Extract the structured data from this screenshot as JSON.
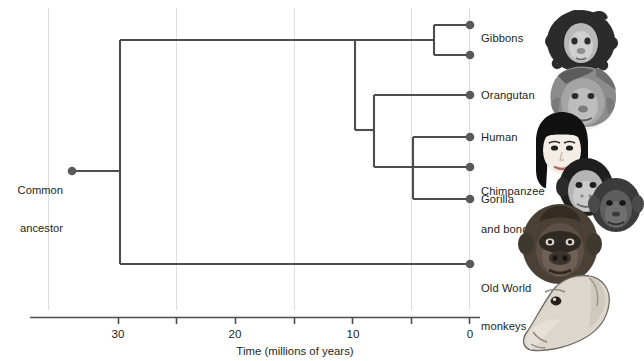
{
  "figure": {
    "type": "phylogenetic-tree",
    "root_label": "Common\nancestor",
    "root_label_line1": "Common",
    "root_label_line2": "ancestor"
  },
  "axis": {
    "title": "Time (millions of years)",
    "direction": "right-to-left",
    "unit": "millions of years ago",
    "range_mya": [
      35,
      0
    ],
    "major_ticks": [
      30,
      20,
      10,
      0
    ],
    "major_tick_labels": [
      "30",
      "20",
      "10",
      "0"
    ],
    "minor_ticks": [
      35,
      25,
      15,
      5
    ],
    "gridlines_mya": [
      35,
      25,
      15,
      5
    ],
    "tick_label_0": "0",
    "tick_label_10": "10",
    "tick_label_20": "20",
    "tick_label_30": "30"
  },
  "taxa": [
    {
      "id": "gibbon-a",
      "label": "Gibbons",
      "label_line1": "Gibbons",
      "label_line2": "",
      "tip_mya": 0,
      "y": 25,
      "art": "gibbon"
    },
    {
      "id": "gibbon-b",
      "label": "",
      "label_line1": "",
      "label_line2": "",
      "tip_mya": 0,
      "y": 55,
      "art": ""
    },
    {
      "id": "orangutan",
      "label": "Orangutan",
      "label_line1": "Orangutan",
      "label_line2": "",
      "tip_mya": 0,
      "y": 95,
      "art": "orangutan"
    },
    {
      "id": "human",
      "label": "Human",
      "label_line1": "Human",
      "label_line2": "",
      "tip_mya": 0,
      "y": 137,
      "art": "human"
    },
    {
      "id": "chimp",
      "label": "Chimpanzee and bonobo",
      "label_line1": "Chimpanzee",
      "label_line2": "and bonobo",
      "tip_mya": 0,
      "y": 167,
      "art": "chimp"
    },
    {
      "id": "gorilla",
      "label": "Gorilla",
      "label_line1": "Gorilla",
      "label_line2": "",
      "tip_mya": 0,
      "y": 199,
      "art": "gorilla"
    },
    {
      "id": "owm",
      "label": "Old World monkeys",
      "label_line1": "Old World",
      "label_line2": "monkeys",
      "tip_mya": 0,
      "y": 264,
      "art": "monkey"
    }
  ],
  "nodes": [
    {
      "id": "root",
      "name": "common-ancestor",
      "mya": 34.0,
      "y": 171
    },
    {
      "id": "catarrhini",
      "name": "catarrhine-split",
      "mya": 30.0,
      "y": 152
    },
    {
      "id": "hominoid",
      "name": "hominoid-split",
      "mya": 10.0,
      "y": 40
    },
    {
      "id": "gibbon-node",
      "name": "gibbon-split",
      "mya": 3.1,
      "y": 40
    },
    {
      "id": "greatape",
      "name": "great-ape-split",
      "mya": 8.4,
      "y": 130
    },
    {
      "id": "african",
      "name": "african-ape-split",
      "mya": 5.0,
      "y": 167
    }
  ],
  "colors": {
    "branch": "#4d4d4d",
    "node_dot": "#595959",
    "axis": "#4d4d4d",
    "gridline": "#d9d9d9",
    "text": "#231f20",
    "background": "#ffffff"
  },
  "geometry": {
    "x_0mya": 470,
    "x_30mya": 118,
    "px_per_myr": 11.733,
    "axis_y": 317
  }
}
